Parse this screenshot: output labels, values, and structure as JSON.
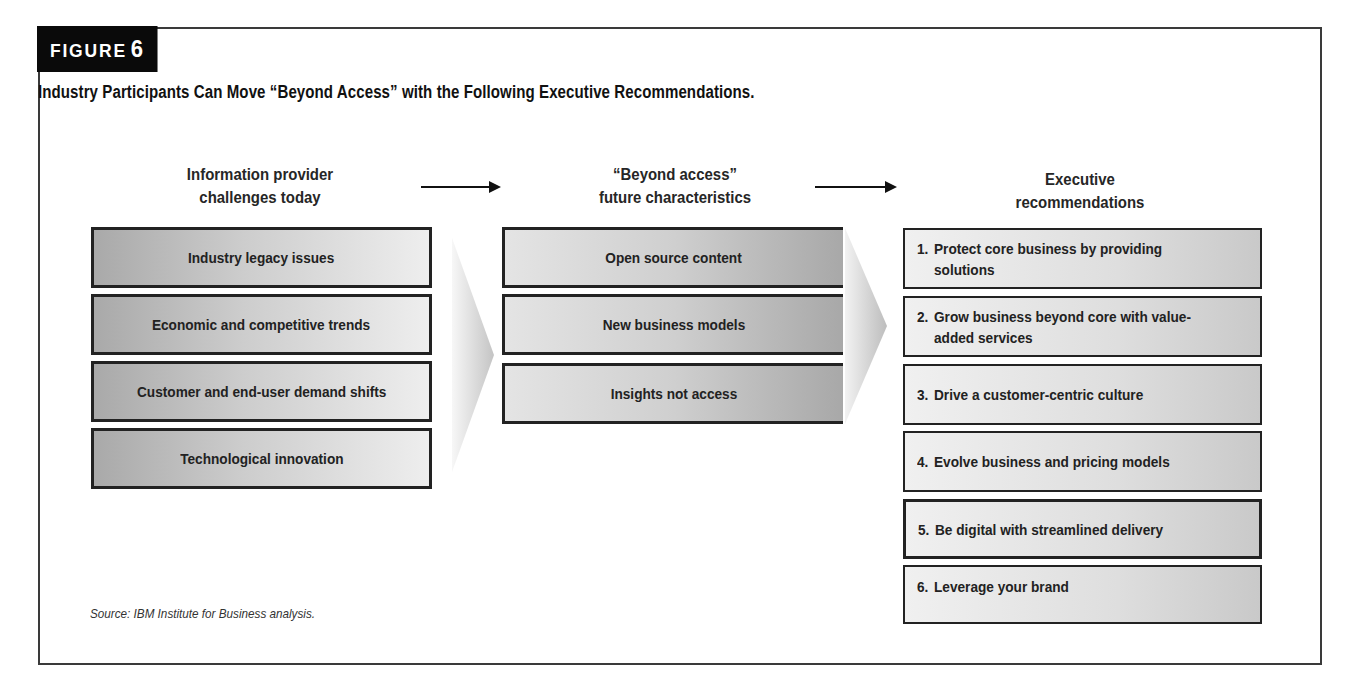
{
  "figure": {
    "label": "FIGURE",
    "number": "6",
    "title": "Industry Participants Can Move “Beyond Access” with the Following Executive Recommendations."
  },
  "columns": [
    {
      "header_line1": "Information provider",
      "header_line2": "challenges today",
      "items": [
        "Industry legacy issues",
        "Economic and competitive trends",
        "Customer and end-user demand shifts",
        "Technological innovation"
      ]
    },
    {
      "header_line1": "“Beyond access”",
      "header_line2": "future characteristics",
      "items": [
        "Open source content",
        "New business models",
        "Insights not access"
      ]
    },
    {
      "header_line1": "Executive",
      "header_line2": "recommendations",
      "items": [
        {
          "num": "1.",
          "text": "Protect core business by providing solutions"
        },
        {
          "num": "2.",
          "text": "Grow business beyond core with value-added services"
        },
        {
          "num": "3.",
          "text": "Drive a customer-centric culture"
        },
        {
          "num": "4.",
          "text": "Evolve business and pricing models"
        },
        {
          "num": "5.",
          "text": "Be digital with streamlined delivery"
        },
        {
          "num": "6.",
          "text": "Leverage your brand"
        }
      ]
    }
  ],
  "flow_arrows": [
    "arrow-right-icon",
    "arrow-right-icon"
  ],
  "source": "Source: IBM Institute for Business analysis.",
  "colors": {
    "label_bg": "#0a0a0a",
    "box_border": "#222222",
    "box_gray_dark": "#a9a9a9",
    "box_gray_light": "#eeeeee"
  }
}
